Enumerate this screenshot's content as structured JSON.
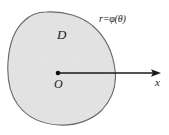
{
  "figure": {
    "type": "polar-region-diagram",
    "background_color": "#ffffff",
    "region": {
      "label": "D",
      "fill_color": "#e6e6e6",
      "stroke_color": "#6b6b6b",
      "stroke_width": 1.1,
      "description": "closed convex-ish blob region"
    },
    "origin": {
      "label": "O",
      "dot_color": "#111111",
      "x": 58,
      "y": 73
    },
    "axis": {
      "label": "x",
      "color": "#1a1a1a",
      "start_x": 58,
      "end_x": 161,
      "y": 73,
      "arrowhead": true
    },
    "curve_label": {
      "text": "r=φ(θ)",
      "r": "r",
      "equals": "=",
      "phi": "φ",
      "open_paren": "(",
      "theta": "θ",
      "close_paren": ")",
      "color": "#1a1a1a"
    }
  }
}
